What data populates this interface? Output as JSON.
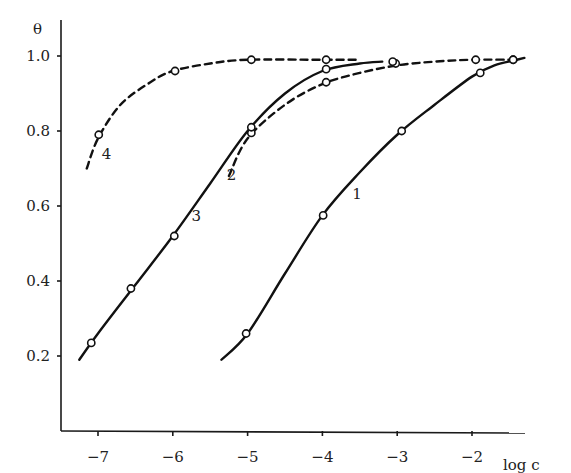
{
  "chart_data": {
    "type": "line",
    "title": "",
    "xlabel": "log c",
    "ylabel": "θ",
    "xlim": [
      -7.4,
      -1.3
    ],
    "ylim": [
      0.0,
      1.05
    ],
    "x_ticks": [
      -7,
      -6,
      -5,
      -4,
      -3,
      -2
    ],
    "x_tick_labels": [
      "−7",
      "−6",
      "−5",
      "−4",
      "−3",
      "−2"
    ],
    "y_ticks": [
      0.2,
      0.4,
      0.6,
      0.8,
      1.0
    ],
    "y_tick_labels": [
      "0.2",
      "0.4",
      "0.6",
      "0.8",
      "1.0"
    ],
    "grid": false,
    "legend": "inline curve numbers",
    "series": [
      {
        "name": "1",
        "style": "solid",
        "label_pos": [
          -3.6,
          0.62
        ],
        "line": [
          [
            -5.35,
            0.19
          ],
          [
            -5.0,
            0.26
          ],
          [
            -4.5,
            0.42
          ],
          [
            -4.0,
            0.575
          ],
          [
            -3.5,
            0.69
          ],
          [
            -3.0,
            0.79
          ],
          [
            -2.5,
            0.87
          ],
          [
            -2.0,
            0.945
          ],
          [
            -1.7,
            0.975
          ],
          [
            -1.4,
            0.99
          ],
          [
            -1.3,
            0.995
          ]
        ],
        "points": [
          [
            -5.02,
            0.26
          ],
          [
            -3.99,
            0.575
          ],
          [
            -2.94,
            0.8
          ],
          [
            -1.89,
            0.955
          ],
          [
            -1.45,
            0.99
          ]
        ]
      },
      {
        "name": "2",
        "style": "dashed",
        "label_pos": [
          -5.28,
          0.67
        ],
        "line": [
          [
            -5.25,
            0.68
          ],
          [
            -5.0,
            0.78
          ],
          [
            -4.5,
            0.87
          ],
          [
            -4.0,
            0.925
          ],
          [
            -3.5,
            0.955
          ],
          [
            -3.0,
            0.975
          ],
          [
            -2.5,
            0.985
          ],
          [
            -2.0,
            0.99
          ],
          [
            -1.4,
            0.99
          ]
        ],
        "points": [
          [
            -4.95,
            0.795
          ],
          [
            -3.95,
            0.93
          ],
          [
            -3.02,
            0.98
          ],
          [
            -1.95,
            0.99
          ],
          [
            -1.45,
            0.99
          ]
        ]
      },
      {
        "name": "3",
        "style": "solid",
        "label_pos": [
          -5.75,
          0.56
        ],
        "line": [
          [
            -7.25,
            0.19
          ],
          [
            -7.0,
            0.26
          ],
          [
            -6.5,
            0.39
          ],
          [
            -6.0,
            0.52
          ],
          [
            -5.5,
            0.66
          ],
          [
            -5.0,
            0.8
          ],
          [
            -4.5,
            0.9
          ],
          [
            -4.0,
            0.96
          ],
          [
            -3.5,
            0.98
          ],
          [
            -3.2,
            0.985
          ]
        ],
        "points": [
          [
            -7.09,
            0.235
          ],
          [
            -6.56,
            0.38
          ],
          [
            -5.98,
            0.52
          ],
          [
            -4.95,
            0.81
          ],
          [
            -3.95,
            0.965
          ],
          [
            -3.06,
            0.985
          ]
        ]
      },
      {
        "name": "4",
        "style": "dashed",
        "label_pos": [
          -6.95,
          0.725
        ],
        "line": [
          [
            -7.15,
            0.7
          ],
          [
            -7.0,
            0.78
          ],
          [
            -6.7,
            0.87
          ],
          [
            -6.3,
            0.93
          ],
          [
            -6.0,
            0.96
          ],
          [
            -5.5,
            0.98
          ],
          [
            -5.0,
            0.99
          ],
          [
            -4.0,
            0.99
          ],
          [
            -3.5,
            0.99
          ]
        ],
        "points": [
          [
            -6.99,
            0.79
          ],
          [
            -5.97,
            0.96
          ],
          [
            -4.95,
            0.99
          ],
          [
            -3.95,
            0.99
          ]
        ]
      }
    ]
  }
}
